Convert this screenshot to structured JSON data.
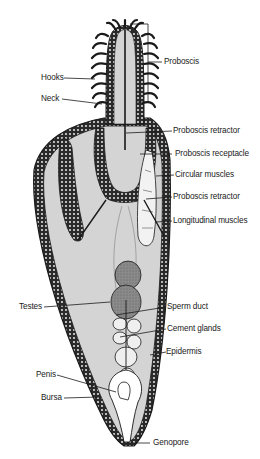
{
  "figure": {
    "colors": {
      "background": "#ffffff",
      "body_fill": "#d4d4d4",
      "outline": "#222222",
      "wall_dots": "#ffffff",
      "testes": "#8a8a8a",
      "glands": "#eeeeee"
    }
  },
  "labels": {
    "proboscis": "Proboscis",
    "hooks": "Hooks",
    "neck": "Neck",
    "proboscis_retractor_1": "Proboscis retractor",
    "proboscis_receptacle": "Proboscis receptacle",
    "circular_muscles": "Circular muscles",
    "proboscis_retractor_2": "Proboscis retractor",
    "longitudinal_muscles": "Longitudinal muscles",
    "testes": "Testes",
    "sperm_duct": "Sperm duct",
    "cement_glands": "Cement glands",
    "epidermis": "Epidermis",
    "penis": "Penis",
    "bursa": "Bursa",
    "genopore": "Genopore"
  }
}
